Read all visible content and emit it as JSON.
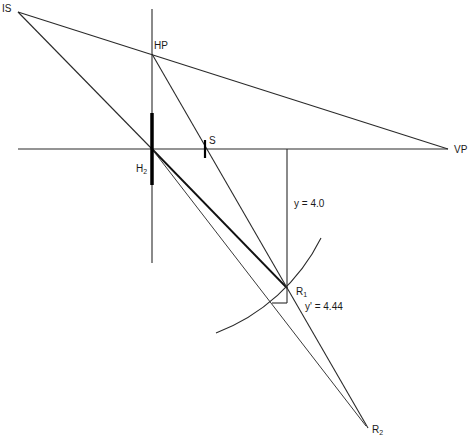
{
  "diagram": {
    "labels": {
      "is": "IS",
      "hp": "HP",
      "vp": "VP",
      "s": "S",
      "h2_main": "H",
      "h2_sub": "2",
      "r1_main": "R",
      "r1_sub": "1",
      "r2_main": "R",
      "r2_sub": "2",
      "y_value": "y = 4.0",
      "y_prime_value": "y' = 4.44"
    },
    "points": [
      {
        "id": "IS",
        "name": "IS"
      },
      {
        "id": "HP",
        "name": "HP"
      },
      {
        "id": "VP",
        "name": "VP"
      },
      {
        "id": "S",
        "name": "S"
      },
      {
        "id": "H2",
        "name": "H2"
      },
      {
        "id": "R1",
        "name": "R1"
      },
      {
        "id": "R2",
        "name": "R2"
      }
    ],
    "measurements": {
      "y": 4.0,
      "y_prime": 4.44
    },
    "colors": {
      "line": "#2a2a2a",
      "background": "#ffffff"
    }
  }
}
